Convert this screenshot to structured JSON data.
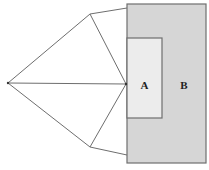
{
  "diagram": {
    "regions": [
      {
        "id": "A",
        "label": "A",
        "fill": "#ececec"
      },
      {
        "id": "B",
        "label": "B",
        "fill": "#d6d6d6"
      }
    ],
    "stroke_color": "#6e6e6e",
    "point_color": "#333333"
  }
}
